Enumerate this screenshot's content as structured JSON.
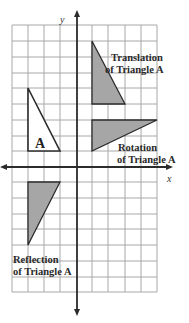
{
  "diagram": {
    "type": "coordinate-plane-transformations",
    "axes": {
      "x_label": "x",
      "y_label": "y"
    },
    "colors": {
      "grid": "#a8a8a8",
      "axis": "#2b2b2b",
      "fill": "#a6a6a6",
      "stroke": "#2b2b2b",
      "original_fill": "#ffffff"
    },
    "triangles": {
      "original": {
        "label": "A",
        "vertices_grid": [
          [
            -3,
            5
          ],
          [
            -3,
            1
          ],
          [
            -1,
            1
          ]
        ]
      },
      "translation": {
        "caption_line1": "Translation",
        "caption_line2": "of Triangle A",
        "vertices_grid": [
          [
            1,
            8
          ],
          [
            1,
            4
          ],
          [
            3,
            4
          ]
        ]
      },
      "rotation": {
        "caption_line1": "Rotation",
        "caption_line2": "of Triangle A",
        "vertices_grid": [
          [
            1,
            3
          ],
          [
            5,
            3
          ],
          [
            1,
            1
          ]
        ]
      },
      "reflection": {
        "caption_line1": "Reflection",
        "caption_line2": "of Triangle A",
        "vertices_grid": [
          [
            -3,
            -1
          ],
          [
            -1,
            -1
          ],
          [
            -3,
            -5
          ]
        ]
      }
    }
  }
}
